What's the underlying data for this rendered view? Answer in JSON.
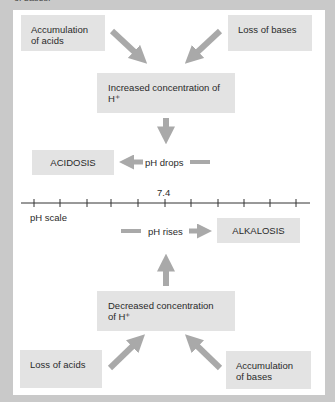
{
  "caption_fragment": "of bases.",
  "boxes": {
    "accumulation_acids": "Accumulation of acids",
    "loss_bases": "Loss of bases",
    "increased_h": "Increased concentration of H⁺",
    "acidosis": "ACIDOSIS",
    "alkalosis": "ALKALOSIS",
    "decreased_h": "Decreased concentration of H⁺",
    "loss_acids": "Loss of acids",
    "accumulation_bases": "Accumulation of bases"
  },
  "labels": {
    "ph_drops": "pH drops",
    "ph_rises": "pH rises",
    "ph_scale": "pH scale",
    "neutral_value": "7.4"
  },
  "colors": {
    "background": "#c9c9c9",
    "panel": "#ffffff",
    "box": "#e3e3e3",
    "arrow": "#a9a9a9",
    "axis": "#333333"
  },
  "scale": {
    "tick_count": 11,
    "center_value": "7.4"
  }
}
